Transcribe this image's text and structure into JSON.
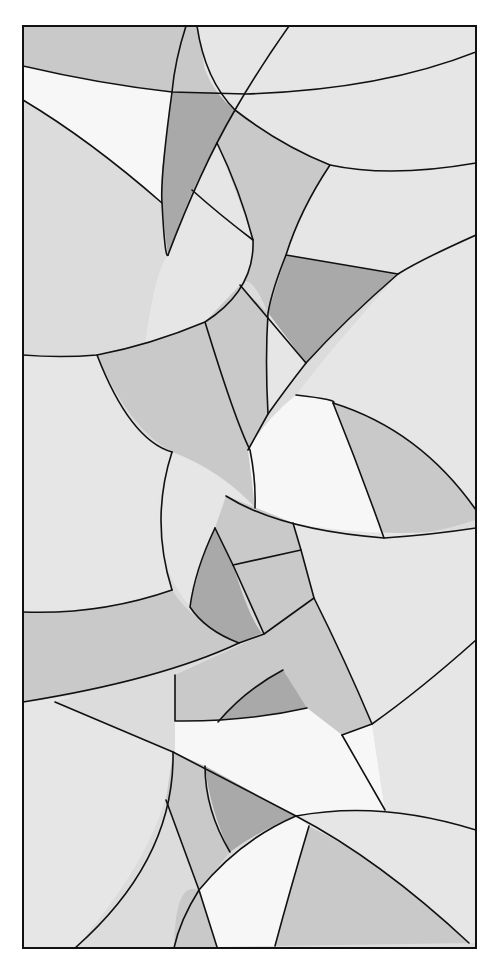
{
  "artwork": {
    "title": "Abstract stained glass panel pattern",
    "frame": {
      "x": 23,
      "y": 26,
      "width": 453,
      "height": 922
    },
    "colors": {
      "background": "#ffffff",
      "lead": "#111111",
      "base": "#dcdcdc",
      "light": "#e6e6e6",
      "white": "#f7f7f7",
      "mid": "#c9c9c9",
      "dark": "#a9a9a9"
    },
    "panels": [
      {
        "name": "top-left-band",
        "shade": "mid",
        "d": "M23,26 L186,26 L172,92 Q100,84 23,66 Z"
      },
      {
        "name": "top-left-white",
        "shade": "white",
        "d": "M23,66 Q100,84 172,92 L162,203 Q90,140 23,100 Z"
      },
      {
        "name": "top-sliver",
        "shade": "mid",
        "d": "M186,26 L197,26 Q205,70 220,92 L172,92 Z"
      },
      {
        "name": "top-dark-wedge",
        "shade": "dark",
        "d": "M172,92 L220,92 L235,110 Q200,170 168,255 Q160,200 162,170 Z"
      },
      {
        "name": "top-center",
        "shade": "light",
        "d": "M197,26 L289,26 Q258,70 235,110 Q215,95 205,70 Z"
      },
      {
        "name": "top-right-band",
        "shade": "light",
        "d": "M289,26 L476,26 L476,52 Q380,90 246,94 Q268,55 289,26 Z"
      },
      {
        "name": "right-upper-band",
        "shade": "light",
        "d": "M476,52 L476,163 Q390,178 330,165 Q280,145 235,110 L246,94 Q380,90 476,52 Z"
      },
      {
        "name": "center-arch",
        "shade": "mid",
        "d": "M235,110 Q280,145 330,165 Q300,220 286,255 L268,313 Q250,270 240,285 Q230,200 217,143 Z"
      },
      {
        "name": "left-big-arc",
        "shade": "base",
        "d": "M23,100 Q90,140 162,203 Q150,280 145,345 Q90,356 23,355 Z"
      },
      {
        "name": "inner-lens",
        "shade": "light",
        "d": "M217,143 Q240,200 253,240 Q255,290 205,322 L145,345 Q155,270 168,255 Q190,190 217,143 Z"
      },
      {
        "name": "upper-right-field",
        "shade": "light",
        "d": "M330,165 Q390,178 476,163 L476,235 Q420,260 398,274 L286,255 Q300,210 330,165 Z"
      },
      {
        "name": "dark-triangle",
        "shade": "dark",
        "d": "M286,255 L398,274 Q345,320 306,363 L268,313 Z"
      },
      {
        "name": "right-mid-field",
        "shade": "light",
        "d": "M476,235 L476,520 Q430,440 333,403 L296,395 Q330,350 398,274 Q440,250 476,235 Z"
      },
      {
        "name": "left-mid-field",
        "shade": "light",
        "d": "M23,355 Q90,356 97,355 Q130,440 172,452 Q160,480 156,520 Q165,560 172,590 Q100,615 23,612 Z"
      },
      {
        "name": "mid-left-curve",
        "shade": "mid",
        "d": "M97,355 Q160,340 205,322 Q235,420 250,450 Q262,495 255,507 Q220,470 172,452 Q130,430 97,355 Z"
      },
      {
        "name": "mid-center-strip",
        "shade": "mid",
        "d": "M205,322 L240,285 L268,313 Q266,370 268,414 L248,450 Q225,390 205,322 Z"
      },
      {
        "name": "mid-gap",
        "shade": "light",
        "d": "M268,313 L306,363 Q285,390 268,414 Q266,360 268,313 Z"
      },
      {
        "name": "white-center",
        "shade": "white",
        "d": "M248,450 Q265,420 296,395 Q340,400 333,403 Q360,460 384,538 Q320,540 255,508 Q252,480 248,450 Z"
      },
      {
        "name": "right-lens",
        "shade": "mid",
        "d": "M333,403 Q420,430 476,510 L476,520 Q430,535 384,538 Q360,470 333,403 Z"
      },
      {
        "name": "center-ring",
        "shade": "light",
        "d": "M172,452 Q220,470 255,508 L215,528 Q195,570 190,607 Q160,570 156,520 Q160,480 172,452 Z"
      },
      {
        "name": "dark-diamond",
        "shade": "dark",
        "d": "M215,528 L233,565 Q250,620 262,633 L239,643 Q205,630 190,607 Q200,560 215,528 Z"
      },
      {
        "name": "cross-band-upper",
        "shade": "mid",
        "d": "M226,496 Q250,505 293,523 L301,550 L233,565 L215,528 Z"
      },
      {
        "name": "cross-band-right",
        "shade": "mid",
        "d": "M233,565 L301,550 L314,598 L264,634 Q248,600 233,565 Z"
      },
      {
        "name": "right-lower-field",
        "shade": "light",
        "d": "M293,523 Q380,540 476,528 L476,640 Q420,690 372,724 Q340,650 314,598 Z"
      },
      {
        "name": "left-band",
        "shade": "mid",
        "d": "M23,612 Q100,615 172,590 Q190,620 239,643 Q160,680 23,702 Z"
      },
      {
        "name": "lower-center-band",
        "shade": "mid",
        "d": "M175,675 L264,634 L285,650 L307,708 Q245,722 175,721 Z"
      },
      {
        "name": "lower-dark-arc",
        "shade": "dark",
        "d": "M218,722 Q245,690 283,670 L307,708 Q260,722 218,722 Z"
      },
      {
        "name": "cross-diagonal",
        "shade": "mid",
        "d": "M264,634 L314,598 Q345,660 372,724 L342,735 L307,708 Z"
      },
      {
        "name": "lower-left-field",
        "shade": "light",
        "d": "M23,702 Q100,690 55,702 L173,752 Q170,840 75,948 L23,948 Z"
      },
      {
        "name": "lower-white",
        "shade": "white",
        "d": "M175,721 Q245,722 307,708 L342,735 L372,724 L385,810 L296,816 Q240,790 175,755 Z"
      },
      {
        "name": "lower-mid-left",
        "shade": "mid",
        "d": "M173,752 L205,766 Q205,810 230,852 L199,890 Q180,840 166,800 Z"
      },
      {
        "name": "lower-dark-tri",
        "shade": "dark",
        "d": "M205,766 L296,816 Q260,830 230,852 Q210,810 205,766 Z"
      },
      {
        "name": "bottom-white",
        "shade": "white",
        "d": "M296,816 L309,826 Q290,890 275,946 L217,947 L199,890 Q240,840 296,816 Z"
      },
      {
        "name": "bottom-mid-left",
        "shade": "mid",
        "d": "M166,800 L199,890 L217,947 L174,948 Q175,880 199,890 Z"
      },
      {
        "name": "bottom-right-field",
        "shade": "mid",
        "d": "M309,826 Q380,860 469,943 L275,946 Q290,890 309,826 Z"
      },
      {
        "name": "bottom-right-arc",
        "shade": "light",
        "d": "M296,816 Q380,800 476,830 L476,943 L469,943 Q380,860 309,826 Z"
      },
      {
        "name": "right-bottom-field",
        "shade": "light",
        "d": "M476,640 L476,830 Q430,815 385,810 L372,724 Q420,690 476,640 Z"
      }
    ],
    "leads": [
      "M23,66 Q100,84 172,92 L246,94 Q380,90 476,52",
      "M23,100 Q90,140 162,203",
      "M186,26 Q175,60 172,92 Q160,180 162,203 Q165,260 168,255",
      "M197,26 Q205,80 235,110 Q280,145 330,165 Q390,178 476,163",
      "M289,26 Q258,70 235,110 Q200,170 168,255",
      "M217,143 Q240,190 253,240 Q255,290 205,322 Q150,345 97,355 Q60,358 23,355",
      "M192,190 Q220,215 253,240",
      "M330,165 Q300,210 286,255 Q272,290 268,313 Q265,360 268,414",
      "M240,285 L306,363",
      "M286,255 L398,274",
      "M476,235 Q420,260 398,274 Q345,320 306,363 Q285,390 268,414 L248,450",
      "M205,322 Q235,420 250,450 Q256,480 255,508",
      "M97,355 Q130,440 172,452",
      "M296,395 Q340,400 333,403 Q420,430 476,510",
      "M333,403 Q360,470 384,538",
      "M172,452 Q150,520 172,590",
      "M226,496 Q280,530 384,538 Q430,535 476,528",
      "M215,528 L233,565 L264,634 L314,598 Q345,660 372,724",
      "M215,528 Q195,570 190,607 Q205,630 239,643",
      "M233,565 L301,550",
      "M293,523 L301,550 L314,598",
      "M23,612 Q100,615 172,590",
      "M23,702 Q160,680 239,643 L264,634",
      "M175,675 L175,721 Q245,722 307,708",
      "M218,722 Q245,690 283,670",
      "M476,640 Q420,690 372,724 L342,735",
      "M55,702 L173,752 L296,816 Q380,860 469,943",
      "M173,752 Q175,860 75,948",
      "M166,800 L199,890 L217,947",
      "M205,766 Q205,810 230,852",
      "M296,816 Q240,840 199,890 Q180,920 174,948",
      "M309,826 Q290,890 275,946",
      "M296,816 Q380,800 476,830",
      "M342,735 L385,810"
    ]
  }
}
